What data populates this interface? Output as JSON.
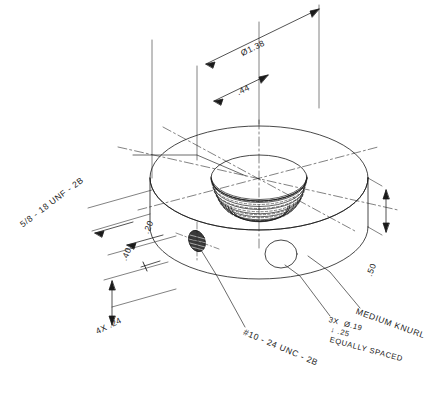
{
  "drawing": {
    "type": "isometric-technical-drawing",
    "subject": "knurled threaded disc / collar",
    "background_color": "#ffffff",
    "line_color": "#1a1a1a",
    "title": ""
  },
  "dimensions": [
    {
      "id": "outer-diameter",
      "label": "Ø1.38",
      "kind": "diameter",
      "value": 1.38
    },
    {
      "id": "center-offset",
      "label": ".44",
      "kind": "linear",
      "value": 0.44
    },
    {
      "id": "hole-offset-20",
      "label": ".20",
      "kind": "linear",
      "value": 0.2
    },
    {
      "id": "hole-offset-40",
      "label": ".40",
      "kind": "linear",
      "value": 0.4
    },
    {
      "id": "repeat-24",
      "label": "4X .24",
      "kind": "linear",
      "value": 0.24,
      "qty": 4
    },
    {
      "id": "thickness-50",
      "label": ".50",
      "kind": "linear",
      "value": 0.5
    }
  ],
  "callouts": [
    {
      "id": "center-thread",
      "label": "5/8 - 18 UNF - 2B"
    },
    {
      "id": "side-thread",
      "label": "#10 - 24 UNC - 2B"
    },
    {
      "id": "drilled-holes",
      "line1": "3X  Ø.19",
      "line2": "↓ .25",
      "line3": "EQUALLY SPACED"
    },
    {
      "id": "knurl",
      "label": "MEDIUM KNURL"
    }
  ]
}
